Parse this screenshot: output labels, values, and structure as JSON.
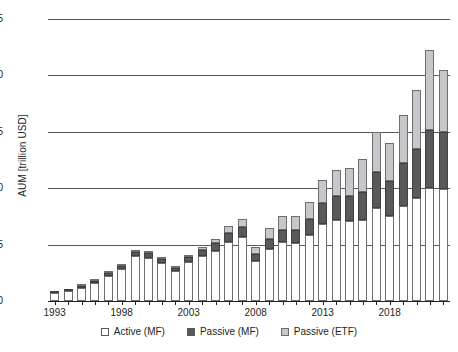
{
  "chart_data": {
    "type": "bar",
    "stacked": true,
    "title": "",
    "xlabel": "",
    "ylabel": "AUM [trillion USD]",
    "ylim": [
      0,
      25
    ],
    "ytick_labels": [
      "0",
      "5",
      "10",
      "15",
      "20",
      "25"
    ],
    "ytick_values": [
      0,
      5,
      10,
      15,
      20,
      25
    ],
    "grid": "horizontal",
    "legend_position": "bottom-center",
    "categories": [
      1993,
      1994,
      1995,
      1996,
      1997,
      1998,
      1999,
      2000,
      2001,
      2002,
      2003,
      2004,
      2005,
      2006,
      2007,
      2008,
      2009,
      2010,
      2011,
      2012,
      2013,
      2014,
      2015,
      2016,
      2017,
      2018,
      2019,
      2020,
      2021,
      2022
    ],
    "xtick_labels": [
      "1993",
      "1998",
      "2003",
      "2008",
      "2013",
      "2018"
    ],
    "xtick_values": [
      1993,
      1998,
      2003,
      2008,
      2013,
      2018
    ],
    "series": [
      {
        "name": "Active (MF)",
        "color": "#ffffff",
        "values": [
          0.72,
          0.88,
          1.18,
          1.62,
          2.25,
          2.85,
          3.95,
          3.85,
          3.35,
          2.62,
          3.45,
          3.95,
          4.45,
          5.25,
          5.65,
          3.55,
          4.65,
          5.25,
          5.15,
          5.85,
          6.85,
          7.15,
          7.05,
          7.15,
          8.25,
          7.55,
          8.45,
          9.15,
          10.05,
          9.95
        ]
      },
      {
        "name": "Passive (MF)",
        "color": "#58595b",
        "values": [
          0.04,
          0.06,
          0.09,
          0.13,
          0.19,
          0.29,
          0.4,
          0.38,
          0.36,
          0.32,
          0.46,
          0.55,
          0.65,
          0.78,
          0.88,
          0.62,
          0.85,
          1.05,
          1.15,
          1.4,
          1.85,
          2.15,
          2.25,
          2.55,
          3.15,
          3.05,
          3.75,
          4.35,
          5.15,
          5.05
        ]
      },
      {
        "name": "Passive (ETF)",
        "color": "#c6c7c9",
        "values": [
          0.0,
          0.0,
          0.01,
          0.01,
          0.02,
          0.04,
          0.07,
          0.08,
          0.09,
          0.11,
          0.19,
          0.28,
          0.4,
          0.58,
          0.78,
          0.62,
          0.95,
          1.2,
          1.25,
          1.55,
          2.05,
          2.35,
          2.45,
          2.85,
          3.55,
          3.4,
          4.25,
          5.25,
          7.05,
          5.45
        ]
      }
    ]
  },
  "legend": {
    "items": [
      {
        "label": "Active (MF)",
        "swatch": "legend-swatch-active-mf"
      },
      {
        "label": "Passive (MF)",
        "swatch": "legend-swatch-passive-mf"
      },
      {
        "label": "Passive (ETF)",
        "swatch": "legend-swatch-passive-etf"
      }
    ]
  },
  "colors": {
    "active_mf": "#ffffff",
    "passive_mf": "#58595b",
    "passive_etf": "#c6c7c9",
    "gridline": "#58595b",
    "axis": "#231f20",
    "text": "#231f20"
  }
}
